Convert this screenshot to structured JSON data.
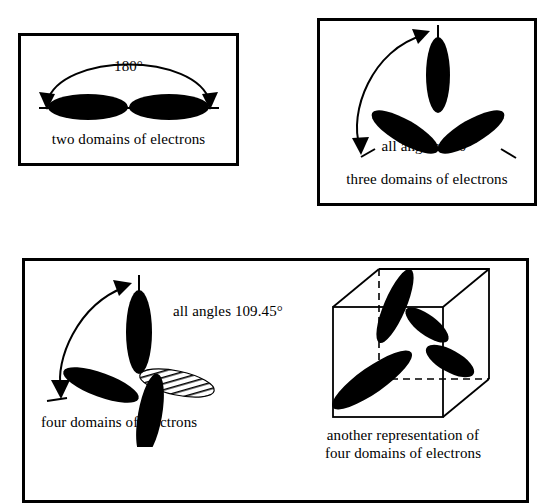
{
  "diagram": {
    "ink_color": "#000000",
    "background": "#ffffff",
    "panels": [
      {
        "id": "two-domains",
        "caption": "two domains of electrons",
        "angle_label": "180°",
        "domain_count": 2,
        "geometry": "linear",
        "lobe_angles_deg": [
          0,
          180
        ],
        "arrow": {
          "type": "double-headed-arc",
          "from_deg": 180,
          "to_deg": 0
        }
      },
      {
        "id": "three-domains",
        "caption": "three domains of electrons",
        "angle_label": "all angles 120°",
        "domain_count": 3,
        "geometry": "trigonal planar",
        "lobe_angles_deg": [
          90,
          210,
          330
        ],
        "arrow": {
          "type": "double-headed-arc",
          "from_deg": 90,
          "to_deg": 210
        }
      },
      {
        "id": "four-domains",
        "caption": "four domains of electrons",
        "angle_label": "all angles 109.45°",
        "domain_count": 4,
        "geometry": "tetrahedral",
        "lobe_angles_deg": [
          90,
          200,
          280,
          15
        ],
        "hatched_lobe_index": 3,
        "arrow": {
          "type": "double-headed-arc",
          "from_deg": 90,
          "to_deg": 200
        }
      },
      {
        "id": "four-domains-cube",
        "caption_line1": "another representation of",
        "caption_line2": "four domains of electrons",
        "domain_count": 4,
        "geometry": "tetrahedral in cube",
        "cube": {
          "hidden_edges": "dashed",
          "visible_edges": "solid"
        }
      }
    ]
  }
}
